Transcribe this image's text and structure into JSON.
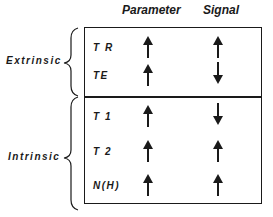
{
  "columns": {
    "parameter": "Parameter",
    "signal": "Signal"
  },
  "groups": [
    {
      "label": "Extrinsic",
      "rows": [
        {
          "label": "T R",
          "parameter": "up-arrow",
          "signal": "up-arrow"
        },
        {
          "label": "TE",
          "parameter": "up-arrow",
          "signal": "down-arrow"
        }
      ]
    },
    {
      "label": "Intrinsic",
      "rows": [
        {
          "label": "T 1",
          "parameter": "up-arrow",
          "signal": "down-arrow"
        },
        {
          "label": "T 2",
          "parameter": "up-arrow",
          "signal": "up-arrow"
        },
        {
          "label": "N(H)",
          "parameter": "up-arrow",
          "signal": "up-arrow"
        }
      ]
    }
  ],
  "colors": {
    "ink": "#1a1a1a",
    "background": "#ffffff"
  }
}
